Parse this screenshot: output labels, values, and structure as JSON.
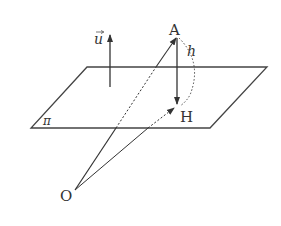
{
  "diagram": {
    "labels": {
      "point_A": "A",
      "point_H": "H",
      "point_O": "O",
      "plane": "π",
      "normal_vector": "u",
      "distance": "h"
    },
    "colors": {
      "stroke": "#333333",
      "background": "#ffffff"
    },
    "elements": [
      {
        "name": "plane-pi",
        "type": "parallelogram"
      },
      {
        "name": "normal-vector-u",
        "type": "arrow"
      },
      {
        "name": "vector-OA",
        "type": "arrow",
        "from": "O",
        "to": "A",
        "hidden_part_dashed": true
      },
      {
        "name": "vector-OH",
        "type": "arrow",
        "from": "O",
        "to": "H",
        "hidden_part_dashed": true
      },
      {
        "name": "vector-AH",
        "type": "arrow",
        "from": "A",
        "to": "H"
      },
      {
        "name": "arc-h",
        "type": "dotted-arc",
        "from": "A",
        "to": "H",
        "label": "h"
      }
    ]
  }
}
